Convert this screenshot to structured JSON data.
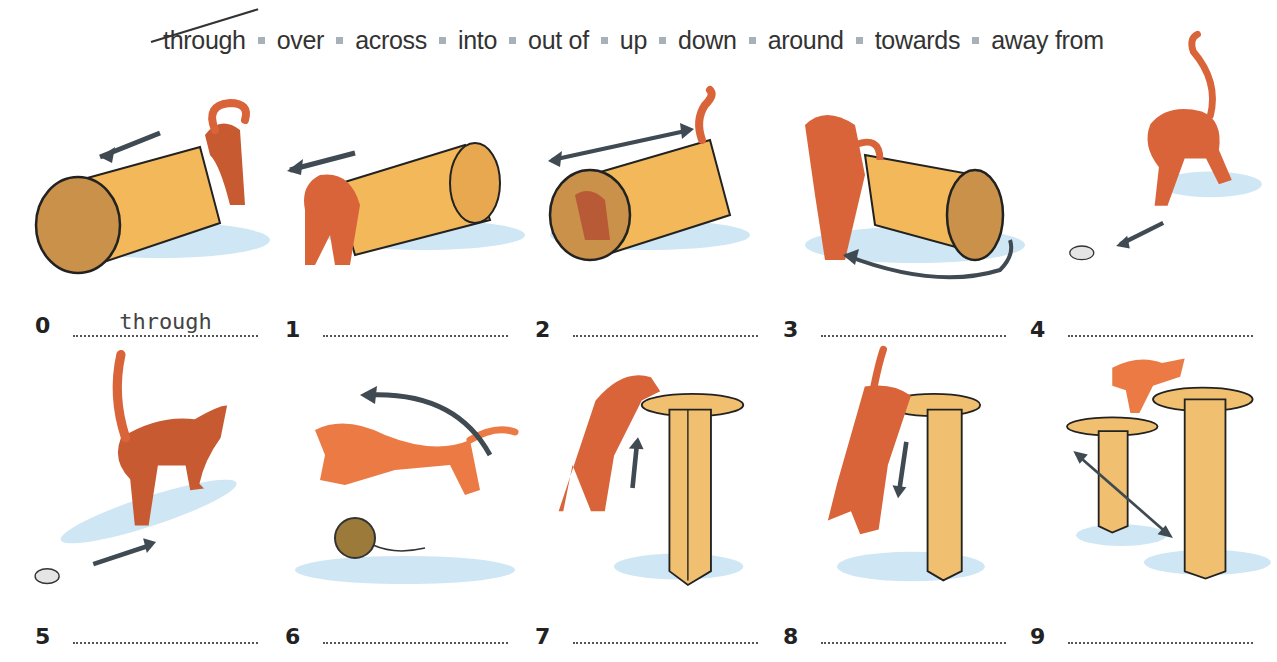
{
  "word_bank": [
    {
      "word": "through",
      "crossed_out": true
    },
    {
      "word": "over",
      "crossed_out": false
    },
    {
      "word": "across",
      "crossed_out": false
    },
    {
      "word": "into",
      "crossed_out": false
    },
    {
      "word": "out of",
      "crossed_out": false
    },
    {
      "word": "up",
      "crossed_out": false
    },
    {
      "word": "down",
      "crossed_out": false
    },
    {
      "word": "around",
      "crossed_out": false
    },
    {
      "word": "towards",
      "crossed_out": false
    },
    {
      "word": "away from",
      "crossed_out": false
    }
  ],
  "items": [
    {
      "number": "0",
      "answer": "through",
      "scene": "cat going through tunnel"
    },
    {
      "number": "1",
      "answer": "",
      "scene": "cat coming out of tunnel"
    },
    {
      "number": "2",
      "answer": "",
      "scene": "cat going into tunnel"
    },
    {
      "number": "3",
      "answer": "",
      "scene": "cat going around tunnel"
    },
    {
      "number": "4",
      "answer": "",
      "scene": "cat running towards mouse"
    },
    {
      "number": "5",
      "answer": "",
      "scene": "cat walking away from mouse"
    },
    {
      "number": "6",
      "answer": "",
      "scene": "cat jumping over ball of wool"
    },
    {
      "number": "7",
      "answer": "",
      "scene": "cat climbing up post"
    },
    {
      "number": "8",
      "answer": "",
      "scene": "cat climbing down post"
    },
    {
      "number": "9",
      "answer": "",
      "scene": "cat walking across between posts"
    }
  ],
  "colors": {
    "cat": "#d9643a",
    "cat_light": "#f08a55",
    "tunnel": "#f3b85a",
    "post": "#f0c070",
    "shadow": "#cfe6f5",
    "arrow": "#3f4a52",
    "separator": "#a9b1b8"
  }
}
